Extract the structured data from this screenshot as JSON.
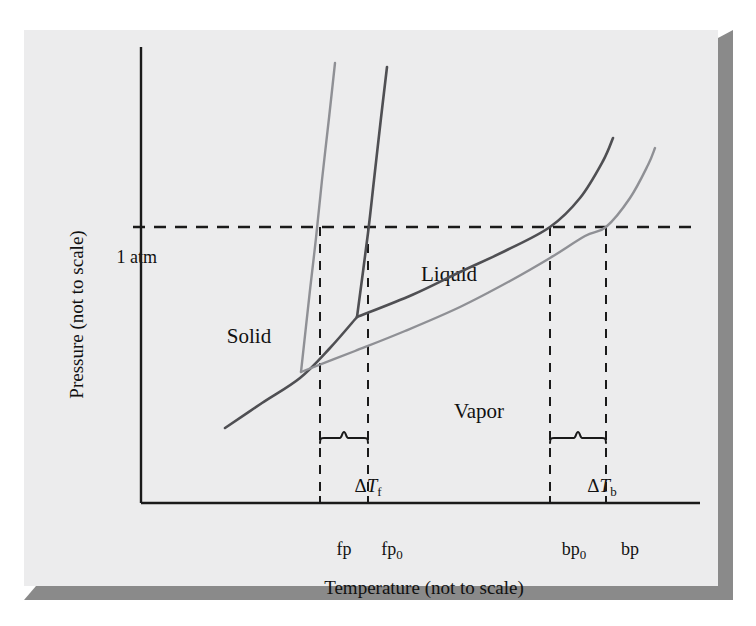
{
  "figure": {
    "kind": "phase-diagram",
    "panel_background": "#ececed",
    "shadow_color": "#8a8a8a"
  },
  "axes": {
    "y_label": "Pressure (not to scale)",
    "x_label": "Temperature (not to scale)",
    "axis_color": "#1a1a1a",
    "origin_px": {
      "x": 141,
      "y": 503
    },
    "y_top_px": 47,
    "x_right_px": 700
  },
  "reference_line": {
    "label": "1 atm",
    "y_px": 227,
    "style": "dashed",
    "color": "#1a1a1a"
  },
  "regions": [
    {
      "name": "solid",
      "label": "Solid"
    },
    {
      "name": "liquid",
      "label": "Liquid"
    },
    {
      "name": "vapor",
      "label": "Vapor"
    }
  ],
  "ticks": [
    {
      "name": "fp",
      "label": "fp",
      "sub": "",
      "x_px": 320
    },
    {
      "name": "fp0",
      "label": "fp",
      "sub": "0",
      "x_px": 368
    },
    {
      "name": "bp0",
      "label": "bp",
      "sub": "0",
      "x_px": 550
    },
    {
      "name": "bp",
      "label": "bp",
      "sub": "",
      "x_px": 606
    }
  ],
  "annotations": [
    {
      "name": "delta-tf",
      "delta": "Δ",
      "symbol": "T",
      "sub": "f",
      "brace_from_px": 320,
      "brace_to_px": 368,
      "brace_y_px": 432
    },
    {
      "name": "delta-tb",
      "delta": "Δ",
      "symbol": "T",
      "sub": "b",
      "brace_from_px": 550,
      "brace_to_px": 606,
      "brace_y_px": 432
    }
  ],
  "chart_data": {
    "type": "line",
    "title": "",
    "xlabel": "Temperature (not to scale)",
    "ylabel": "Pressure (not to scale)",
    "xlim": [
      141,
      700
    ],
    "ylim": [
      503,
      47
    ],
    "grid": false,
    "legend": "none",
    "reference_lines": [
      {
        "name": "1 atm",
        "orientation": "horizontal",
        "y_px": 227,
        "dash": "12 9"
      }
    ],
    "curves": [
      {
        "name": "sublimation-pure-solvent",
        "role": "solid-vapor boundary (pure solvent)",
        "color": "#4f4f53",
        "width": 2.6,
        "points_px": [
          [
            225,
            428
          ],
          [
            262,
            403
          ],
          [
            300,
            378
          ],
          [
            330,
            348
          ],
          [
            357,
            317
          ]
        ]
      },
      {
        "name": "fusion-pure-solvent",
        "role": "solid-liquid boundary (pure solvent)",
        "color": "#4f4f53",
        "width": 2.6,
        "points_px": [
          [
            357,
            317
          ],
          [
            368,
            233
          ],
          [
            374,
            180
          ],
          [
            381,
            118
          ],
          [
            387,
            67
          ]
        ]
      },
      {
        "name": "vaporization-pure-solvent",
        "role": "liquid-vapor boundary (pure solvent)",
        "color": "#4f4f53",
        "width": 2.6,
        "points_px": [
          [
            357,
            317
          ],
          [
            412,
            295
          ],
          [
            460,
            272
          ],
          [
            505,
            251
          ],
          [
            550,
            227
          ],
          [
            580,
            198
          ],
          [
            603,
            161
          ],
          [
            613,
            138
          ]
        ]
      },
      {
        "name": "fusion-solution",
        "role": "solid-liquid boundary (solution, depressed freezing point)",
        "color": "#8f9095",
        "width": 2.4,
        "points_px": [
          [
            301,
            372
          ],
          [
            310,
            290
          ],
          [
            316,
            238
          ],
          [
            322,
            180
          ],
          [
            329,
            118
          ],
          [
            335,
            63
          ]
        ]
      },
      {
        "name": "vaporization-solution",
        "role": "liquid-vapor boundary (solution, elevated boiling point)",
        "color": "#8f9095",
        "width": 2.4,
        "points_px": [
          [
            301,
            372
          ],
          [
            355,
            351
          ],
          [
            405,
            331
          ],
          [
            460,
            307
          ],
          [
            510,
            281
          ],
          [
            550,
            258
          ],
          [
            585,
            236
          ],
          [
            606,
            227
          ],
          [
            630,
            198
          ],
          [
            648,
            165
          ],
          [
            655,
            148
          ]
        ]
      }
    ],
    "drop_lines": [
      {
        "name": "fp-drop",
        "x_px": 320,
        "y_from_px": 227,
        "y_to_px": 503
      },
      {
        "name": "fp0-drop",
        "x_px": 368,
        "y_from_px": 227,
        "y_to_px": 503
      },
      {
        "name": "bp0-drop",
        "x_px": 550,
        "y_from_px": 227,
        "y_to_px": 503
      },
      {
        "name": "bp-drop",
        "x_px": 606,
        "y_from_px": 227,
        "y_to_px": 503
      }
    ],
    "annotation_points": [
      {
        "name": "triple-point-pure",
        "x_px": 357,
        "y_px": 317
      },
      {
        "name": "triple-point-solution",
        "x_px": 301,
        "y_px": 372
      }
    ]
  }
}
